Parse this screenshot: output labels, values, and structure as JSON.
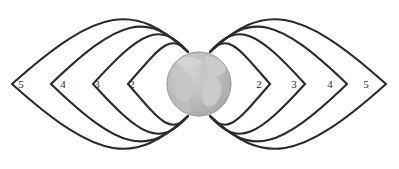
{
  "figure": {
    "name": "earth-dipole-magnetic-field-lines",
    "background_color": "#ffffff",
    "width": 399,
    "height": 169
  },
  "globe": {
    "name": "earth-globe",
    "center_x": 199,
    "center_y": 84,
    "radius": 32,
    "ocean_color": "#b6b6b6",
    "land_color": "#cfcfcf",
    "edge_color": "#a8a8a8"
  },
  "field_lines": {
    "stroke_color": "#2b2b2b",
    "stroke_width": 2.1,
    "north_pole_x_left": 188,
    "north_pole_x_right": 210,
    "north_pole_y": 52,
    "south_pole_y": 116,
    "shells": [
      {
        "l_value": "2",
        "apex_x": 128,
        "half_height": 34
      },
      {
        "l_value": "3",
        "apex_x": 93,
        "half_height": 52
      },
      {
        "l_value": "4",
        "apex_x": 51,
        "half_height": 66
      },
      {
        "l_value": "5",
        "apex_x": 12,
        "half_height": 79
      }
    ]
  },
  "labels": {
    "name": "l-shell-labels",
    "left": [
      {
        "text": "5",
        "x": 21,
        "y": 84
      },
      {
        "text": "4",
        "x": 63,
        "y": 84
      },
      {
        "text": "3",
        "x": 97,
        "y": 84
      },
      {
        "text": "2",
        "x": 132,
        "y": 84
      }
    ],
    "right": [
      {
        "text": "2",
        "x": 259,
        "y": 84
      },
      {
        "text": "3",
        "x": 294,
        "y": 84
      },
      {
        "text": "4",
        "x": 330,
        "y": 84
      },
      {
        "text": "5",
        "x": 366,
        "y": 84
      }
    ]
  }
}
